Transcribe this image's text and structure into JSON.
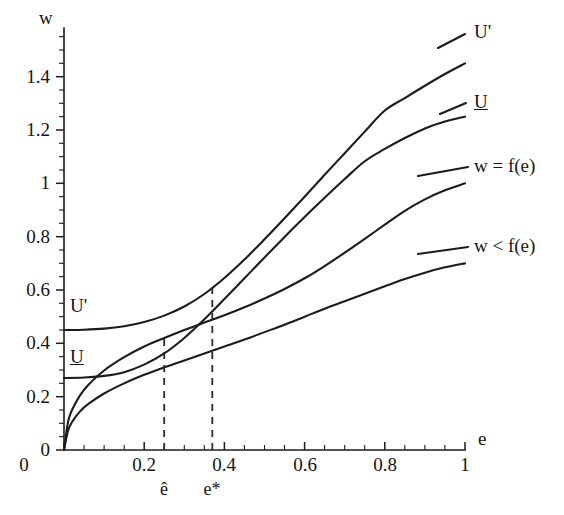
{
  "figure": {
    "background_color": "#ffffff",
    "ink_color": "#1c1c1c"
  },
  "chart_data": {
    "type": "line",
    "title": "",
    "subtitle": "",
    "xlabel": "e",
    "ylabel": "w",
    "xlim": [
      0,
      1
    ],
    "ylim": [
      0,
      1.5
    ],
    "grid": false,
    "legend_position": "inline-right-of-curve-ends",
    "x_ticks": [
      {
        "value": 0,
        "label": "0"
      },
      {
        "value": 0.2,
        "label": "0.2"
      },
      {
        "value": 0.4,
        "label": "0.4"
      },
      {
        "value": 0.6,
        "label": "0.6"
      },
      {
        "value": 0.8,
        "label": "0.8"
      },
      {
        "value": 1,
        "label": "1"
      }
    ],
    "x_minor_tick_step": 0.05,
    "y_ticks": [
      {
        "value": 0,
        "label": "0"
      },
      {
        "value": 0.2,
        "label": "0.2"
      },
      {
        "value": 0.4,
        "label": "0.4"
      },
      {
        "value": 0.6,
        "label": "0.6"
      },
      {
        "value": 0.8,
        "label": "0.8"
      },
      {
        "value": 1.0,
        "label": "1"
      },
      {
        "value": 1.2,
        "label": "1.2"
      },
      {
        "value": 1.4,
        "label": "1.4"
      }
    ],
    "y_minor_tick_step": 0.05,
    "series": [
      {
        "name": "U'",
        "label_right": "U'",
        "label_left": "U'",
        "description": "higher indifference curve, flat near w=0.45 then rising steeply",
        "points": [
          [
            0.0,
            0.45
          ],
          [
            0.05,
            0.451
          ],
          [
            0.1,
            0.455
          ],
          [
            0.15,
            0.464
          ],
          [
            0.2,
            0.48
          ],
          [
            0.25,
            0.504
          ],
          [
            0.3,
            0.538
          ],
          [
            0.35,
            0.585
          ],
          [
            0.4,
            0.645
          ],
          [
            0.45,
            0.714
          ],
          [
            0.5,
            0.79
          ],
          [
            0.55,
            0.869
          ],
          [
            0.6,
            0.95
          ],
          [
            0.65,
            1.032
          ],
          [
            0.7,
            1.113
          ],
          [
            0.75,
            1.194
          ],
          [
            0.8,
            1.273
          ],
          [
            0.85,
            1.32
          ],
          [
            0.9,
            1.366
          ],
          [
            0.95,
            1.41
          ],
          [
            1.0,
            1.45
          ]
        ]
      },
      {
        "name": "U",
        "label_right": "U",
        "label_left": "U",
        "description": "lower indifference curve, flat near w=0.27 then rising steeply",
        "points": [
          [
            0.0,
            0.27
          ],
          [
            0.05,
            0.272
          ],
          [
            0.1,
            0.278
          ],
          [
            0.15,
            0.292
          ],
          [
            0.2,
            0.32
          ],
          [
            0.25,
            0.362
          ],
          [
            0.3,
            0.42
          ],
          [
            0.35,
            0.49
          ],
          [
            0.4,
            0.566
          ],
          [
            0.45,
            0.644
          ],
          [
            0.5,
            0.722
          ],
          [
            0.55,
            0.799
          ],
          [
            0.6,
            0.874
          ],
          [
            0.65,
            0.946
          ],
          [
            0.7,
            1.016
          ],
          [
            0.75,
            1.083
          ],
          [
            0.8,
            1.129
          ],
          [
            0.85,
            1.17
          ],
          [
            0.9,
            1.206
          ],
          [
            0.95,
            1.232
          ],
          [
            1.0,
            1.25
          ]
        ]
      },
      {
        "name": "w = f(e)",
        "label_right": "w = f(e)",
        "description": "upper effort function, concave, from origin to w=1 at e=1",
        "points": [
          [
            0.0,
            0.0
          ],
          [
            0.01,
            0.105
          ],
          [
            0.02,
            0.15
          ],
          [
            0.04,
            0.205
          ],
          [
            0.06,
            0.243
          ],
          [
            0.1,
            0.298
          ],
          [
            0.15,
            0.348
          ],
          [
            0.2,
            0.388
          ],
          [
            0.25,
            0.42
          ],
          [
            0.3,
            0.45
          ],
          [
            0.35,
            0.478
          ],
          [
            0.4,
            0.505
          ],
          [
            0.45,
            0.535
          ],
          [
            0.5,
            0.568
          ],
          [
            0.55,
            0.604
          ],
          [
            0.6,
            0.644
          ],
          [
            0.65,
            0.69
          ],
          [
            0.7,
            0.74
          ],
          [
            0.75,
            0.792
          ],
          [
            0.8,
            0.845
          ],
          [
            0.85,
            0.897
          ],
          [
            0.9,
            0.94
          ],
          [
            0.95,
            0.974
          ],
          [
            1.0,
            1.0
          ]
        ]
      },
      {
        "name": "w < f(e)",
        "label_right": "w < f(e)",
        "description": "lower effort function, concave, from origin to w=0.70 at e=1",
        "points": [
          [
            0.0,
            0.0
          ],
          [
            0.01,
            0.072
          ],
          [
            0.02,
            0.105
          ],
          [
            0.04,
            0.145
          ],
          [
            0.06,
            0.172
          ],
          [
            0.1,
            0.212
          ],
          [
            0.15,
            0.25
          ],
          [
            0.2,
            0.282
          ],
          [
            0.25,
            0.31
          ],
          [
            0.3,
            0.336
          ],
          [
            0.35,
            0.362
          ],
          [
            0.4,
            0.388
          ],
          [
            0.45,
            0.414
          ],
          [
            0.5,
            0.442
          ],
          [
            0.55,
            0.47
          ],
          [
            0.6,
            0.5
          ],
          [
            0.65,
            0.53
          ],
          [
            0.7,
            0.558
          ],
          [
            0.75,
            0.586
          ],
          [
            0.8,
            0.614
          ],
          [
            0.85,
            0.641
          ],
          [
            0.9,
            0.665
          ],
          [
            0.95,
            0.685
          ],
          [
            1.0,
            0.7
          ]
        ]
      }
    ],
    "annotations": [
      {
        "name": "e-hat",
        "label": "ê",
        "x": 0.25,
        "y": 0.42,
        "type": "vertical-dashed-tangency"
      },
      {
        "name": "e-star",
        "label": "e*",
        "x": 0.37,
        "y": 0.628,
        "type": "vertical-dashed-tangency"
      }
    ]
  },
  "labels": {
    "y_axis_name": "w",
    "x_axis_name": "e",
    "left_u_prime": "U'",
    "left_u": "U",
    "right_u_prime": "U'",
    "right_u": "U",
    "right_w_eq": "w = f(e)",
    "right_w_lt": "w < f(e)",
    "e_hat": "ê",
    "e_star": "e*"
  }
}
